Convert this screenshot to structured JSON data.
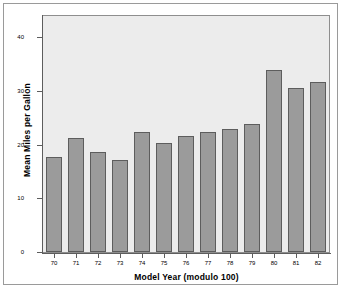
{
  "chart_data": {
    "type": "bar",
    "title": "",
    "subtitle": "",
    "xlabel": "Model Year (modulo 100)",
    "ylabel": "Mean Miles per Gallon",
    "categories": [
      "70",
      "71",
      "72",
      "73",
      "74",
      "75",
      "76",
      "77",
      "78",
      "79",
      "80",
      "81",
      "82"
    ],
    "values": [
      17.7,
      21.3,
      18.7,
      17.2,
      22.4,
      20.3,
      21.6,
      22.3,
      23.0,
      23.8,
      33.9,
      30.5,
      31.7
    ],
    "series": [
      {
        "name": "Mean Miles per Gallon",
        "values": [
          17.7,
          21.3,
          18.7,
          17.2,
          22.4,
          20.3,
          21.6,
          22.3,
          23.0,
          23.8,
          33.9,
          30.5,
          31.7
        ]
      }
    ],
    "ylim": [
      0,
      44
    ],
    "yticks": [
      0,
      10,
      20,
      30,
      40
    ],
    "ytick_labels": [
      "0",
      "10",
      "20",
      "30",
      "40"
    ],
    "grid": false,
    "legend": false,
    "legend_position": "none",
    "colors": {
      "bar_fill": "#9b9b9b",
      "bar_border": "#5d5d5d",
      "plot_background": "#ececec",
      "figure_background": "#ffffff",
      "axis": "#5d5d5d",
      "text": "#000000"
    }
  }
}
